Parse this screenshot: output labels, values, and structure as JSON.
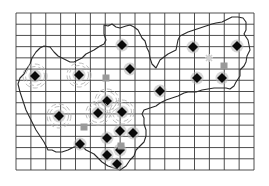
{
  "map": {
    "width": 269,
    "height": 186,
    "background": "#ffffff",
    "grid": {
      "x0": 16,
      "x1": 254,
      "y0": 13,
      "y1": 170,
      "cols": 16,
      "rows": 14,
      "color": "#3a3a3a",
      "line_width": 0.9
    },
    "boundary": {
      "color": "#2a2a2a",
      "line_width": 1.1,
      "points": [
        [
          104,
          25
        ],
        [
          108,
          26
        ],
        [
          112,
          24
        ],
        [
          116,
          27
        ],
        [
          120,
          28
        ],
        [
          126,
          26
        ],
        [
          130,
          25
        ],
        [
          134,
          27
        ],
        [
          138,
          30
        ],
        [
          140,
          34
        ],
        [
          142,
          38
        ],
        [
          145,
          41
        ],
        [
          147,
          48
        ],
        [
          149,
          52
        ],
        [
          150,
          58
        ],
        [
          152,
          64
        ],
        [
          154,
          66
        ],
        [
          156,
          68
        ],
        [
          158,
          64
        ],
        [
          160,
          60
        ],
        [
          164,
          57
        ],
        [
          168,
          54
        ],
        [
          172,
          52
        ],
        [
          176,
          50
        ],
        [
          178,
          40
        ],
        [
          180,
          36
        ],
        [
          184,
          34
        ],
        [
          188,
          32
        ],
        [
          194,
          30
        ],
        [
          200,
          28
        ],
        [
          206,
          26
        ],
        [
          212,
          24
        ],
        [
          216,
          23
        ],
        [
          222,
          22
        ],
        [
          226,
          20
        ],
        [
          232,
          17
        ],
        [
          238,
          17
        ],
        [
          243,
          18
        ],
        [
          246,
          22
        ],
        [
          246,
          30
        ],
        [
          244,
          34
        ],
        [
          248,
          40
        ],
        [
          250,
          50
        ],
        [
          247,
          56
        ],
        [
          246,
          62
        ],
        [
          244,
          66
        ],
        [
          240,
          70
        ],
        [
          240,
          76
        ],
        [
          236,
          82
        ],
        [
          234,
          86
        ],
        [
          230,
          89
        ],
        [
          226,
          88
        ],
        [
          220,
          88
        ],
        [
          214,
          88
        ],
        [
          208,
          89
        ],
        [
          202,
          90
        ],
        [
          196,
          92
        ],
        [
          188,
          92
        ],
        [
          184,
          93
        ],
        [
          178,
          96
        ],
        [
          172,
          98
        ],
        [
          166,
          100
        ],
        [
          160,
          103
        ],
        [
          156,
          106
        ],
        [
          150,
          108
        ],
        [
          144,
          110
        ],
        [
          142,
          114
        ],
        [
          144,
          118
        ],
        [
          144,
          124
        ],
        [
          146,
          130
        ],
        [
          146,
          136
        ],
        [
          144,
          142
        ],
        [
          140,
          146
        ],
        [
          136,
          150
        ],
        [
          134,
          156
        ],
        [
          130,
          160
        ],
        [
          126,
          166
        ],
        [
          120,
          170
        ],
        [
          114,
          168
        ],
        [
          108,
          166
        ],
        [
          102,
          162
        ],
        [
          98,
          158
        ],
        [
          94,
          154
        ],
        [
          90,
          152
        ],
        [
          86,
          150
        ],
        [
          84,
          148
        ],
        [
          82,
          146
        ],
        [
          80,
          144
        ],
        [
          76,
          146
        ],
        [
          72,
          148
        ],
        [
          68,
          150
        ],
        [
          62,
          152
        ],
        [
          56,
          152
        ],
        [
          52,
          150
        ],
        [
          48,
          150
        ],
        [
          46,
          146
        ],
        [
          44,
          142
        ],
        [
          40,
          136
        ],
        [
          36,
          130
        ],
        [
          34,
          126
        ],
        [
          30,
          118
        ],
        [
          26,
          110
        ],
        [
          24,
          104
        ],
        [
          22,
          98
        ],
        [
          20,
          92
        ],
        [
          18,
          84
        ],
        [
          20,
          78
        ],
        [
          24,
          74
        ],
        [
          26,
          70
        ],
        [
          30,
          64
        ],
        [
          32,
          58
        ],
        [
          36,
          52
        ],
        [
          40,
          48
        ],
        [
          44,
          46
        ],
        [
          50,
          47
        ],
        [
          54,
          52
        ],
        [
          58,
          56
        ],
        [
          62,
          58
        ],
        [
          66,
          60
        ],
        [
          70,
          62
        ],
        [
          74,
          62
        ],
        [
          78,
          60
        ],
        [
          82,
          58
        ],
        [
          86,
          54
        ],
        [
          90,
          52
        ],
        [
          94,
          50
        ],
        [
          100,
          46
        ],
        [
          104,
          44
        ],
        [
          106,
          40
        ],
        [
          104,
          34
        ],
        [
          104,
          25
        ]
      ]
    },
    "symbols": {
      "diamond_color": "#0a0a0a",
      "halo_color": "#b5b5b5",
      "square_color": "#9a9a9a",
      "star_color": "#d0d0d0"
    },
    "markers": [
      {
        "type": "diamond-ring",
        "x": 35,
        "y": 76
      },
      {
        "type": "diamond-ring",
        "x": 79,
        "y": 75
      },
      {
        "type": "diamond-ring",
        "x": 59,
        "y": 116
      },
      {
        "type": "diamond-ring",
        "x": 107,
        "y": 101
      },
      {
        "type": "diamond-ring",
        "x": 98,
        "y": 113
      },
      {
        "type": "diamond-ring",
        "x": 122,
        "y": 112
      },
      {
        "type": "diamond",
        "x": 122,
        "y": 45
      },
      {
        "type": "diamond",
        "x": 130,
        "y": 69
      },
      {
        "type": "diamond",
        "x": 160,
        "y": 91
      },
      {
        "type": "diamond",
        "x": 193,
        "y": 47
      },
      {
        "type": "diamond",
        "x": 237,
        "y": 46
      },
      {
        "type": "diamond",
        "x": 197,
        "y": 78
      },
      {
        "type": "diamond",
        "x": 222,
        "y": 78
      },
      {
        "type": "diamond",
        "x": 133,
        "y": 133
      },
      {
        "type": "diamond",
        "x": 120,
        "y": 131
      },
      {
        "type": "diamond",
        "x": 107,
        "y": 138
      },
      {
        "type": "diamond",
        "x": 80,
        "y": 144
      },
      {
        "type": "diamond",
        "x": 107,
        "y": 155
      },
      {
        "type": "diamond",
        "x": 120,
        "y": 150
      },
      {
        "type": "diamond",
        "x": 117,
        "y": 164
      },
      {
        "type": "square",
        "x": 106,
        "y": 78
      },
      {
        "type": "square",
        "x": 84,
        "y": 127
      },
      {
        "type": "square",
        "x": 121,
        "y": 146
      },
      {
        "type": "square",
        "x": 224,
        "y": 66
      },
      {
        "type": "star",
        "x": 209,
        "y": 58
      }
    ]
  }
}
